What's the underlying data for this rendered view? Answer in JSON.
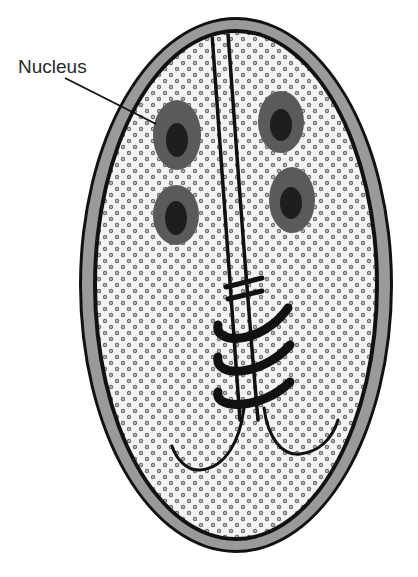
{
  "figure": {
    "labels": [
      {
        "id": "nucleus",
        "text": "Nucleus"
      }
    ]
  },
  "colors": {
    "background": "#ffffff",
    "outline": "#111111",
    "cell_wall_band": "#9a9a9a",
    "cytoplasm": "#f4f4f4",
    "cytoplasm_dot": "#6e6e6e",
    "nucleus_outer": "#5a5a5a",
    "nucleus_inner": "#1e1e1e",
    "structure_lines": "#111111",
    "label_text": "#2a2a2a"
  },
  "cell": {
    "center": [
      236,
      285
    ],
    "outer_rx": 157,
    "outer_ry": 268,
    "inner_rx": 141,
    "inner_ry": 254
  },
  "nuclei": [
    {
      "id": "nucleus-1",
      "cx": 177,
      "cy": 135,
      "rx": 24,
      "ry": 35,
      "inner_cx": 177,
      "inner_cy": 140,
      "inner_rx": 11,
      "inner_ry": 17
    },
    {
      "id": "nucleus-2",
      "cx": 281,
      "cy": 122,
      "rx": 23,
      "ry": 31,
      "inner_cx": 281,
      "inner_cy": 125,
      "inner_rx": 11,
      "inner_ry": 16
    },
    {
      "id": "nucleus-3",
      "cx": 176,
      "cy": 215,
      "rx": 23,
      "ry": 30,
      "inner_cx": 176,
      "inner_cy": 218,
      "inner_rx": 11,
      "inner_ry": 17
    },
    {
      "id": "nucleus-4",
      "cx": 292,
      "cy": 200,
      "rx": 23,
      "ry": 33,
      "inner_cx": 291,
      "inner_cy": 203,
      "inner_rx": 11,
      "inner_ry": 16
    }
  ]
}
